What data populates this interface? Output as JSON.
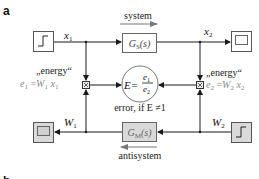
{
  "panel_labels": {
    "a": "a",
    "b": "b"
  },
  "top": {
    "direction_label": "system",
    "input_signal": "x",
    "input_signal_sub": "1",
    "output_signal": "x",
    "output_signal_sub": "2",
    "block": {
      "name": "G",
      "sub": "S",
      "arg": "(s)"
    }
  },
  "bottom": {
    "direction_label": "antisystem",
    "input_signal": "W",
    "input_signal_sub": "2",
    "output_signal": "W",
    "output_signal_sub": "1",
    "block": {
      "name": "G",
      "sub": "M",
      "arg": "(s)"
    }
  },
  "left_energy": {
    "title": "„energy“",
    "lhs": "e",
    "lhs_sub": "1",
    "eq": " =",
    "w": "W",
    "w_sub": "1",
    "x": "x",
    "x_sub": "1"
  },
  "right_energy": {
    "title": "„energy“",
    "lhs": "e",
    "lhs_sub": "2",
    "eq": " =",
    "w": "W",
    "w_sub": "2",
    "x": "x",
    "x_sub": "2"
  },
  "ratio": {
    "lhs": "E=",
    "num": "e",
    "num_sub": "1",
    "den": "e",
    "den_sub": "2",
    "note": "error, if  E ≠1"
  },
  "colors": {
    "line": "#1a1a1a",
    "block_fill_top": "#ffffff",
    "block_fill_bottom": "#d9d9d9",
    "energy_text": "#8a8a8a"
  }
}
